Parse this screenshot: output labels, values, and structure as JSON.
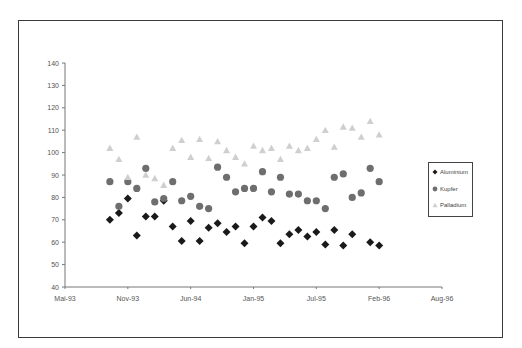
{
  "chart_data": {
    "type": "scatter",
    "title": "",
    "xlabel": "",
    "ylabel": "",
    "ylim": [
      40,
      140
    ],
    "y_ticks": [
      40,
      50,
      60,
      70,
      80,
      90,
      100,
      110,
      120,
      130,
      140
    ],
    "x_tick_labels": [
      "Mai-93",
      "Nov-93",
      "Jun-94",
      "Jan-95",
      "Jul-95",
      "Feb-96",
      "Aug-96"
    ],
    "grid": false,
    "legend_position": "right",
    "x": [
      "Oct-93",
      "Nov-93",
      "Dec-93",
      "Jan-94",
      "Feb-94",
      "Mar-94",
      "Apr-94",
      "May-94",
      "Jun-94",
      "Jul-94",
      "Aug-94",
      "Sep-94",
      "Oct-94",
      "Nov-94",
      "Dec-94",
      "Jan-95",
      "Feb-95",
      "Mar-95",
      "Apr-95",
      "May-95",
      "Jun-95",
      "Jul-95",
      "Aug-95",
      "Sep-95",
      "Oct-95",
      "Nov-95",
      "Dec-95",
      "Jan-96",
      "Feb-96",
      "Mar-96",
      "Apr-96"
    ],
    "series": [
      {
        "name": "Aluminium",
        "marker": "diamond",
        "color": "#1a1a1a",
        "values": [
          70,
          73,
          79.5,
          63,
          71.5,
          71.5,
          78.5,
          67,
          60.5,
          69.5,
          60.5,
          66.5,
          68.5,
          64.5,
          67,
          59.5,
          67,
          71,
          69.5,
          59.5,
          63.5,
          65.5,
          62.5,
          64.5,
          59,
          65.5,
          58.5,
          63.5,
          null,
          60,
          58.5
        ]
      },
      {
        "name": "Kupfer",
        "marker": "circle",
        "color": "#6e6e6e",
        "values": [
          87,
          76,
          87,
          84,
          93,
          78,
          79.5,
          87,
          78.5,
          80.5,
          76,
          75,
          93.5,
          89,
          82.5,
          84,
          84,
          91.5,
          82.5,
          89,
          81.5,
          81.5,
          78.5,
          78.5,
          75,
          89,
          90.5,
          80,
          82,
          93,
          87
        ]
      },
      {
        "name": "Palladium",
        "marker": "triangle",
        "color": "#cfcfcf",
        "values": [
          102,
          97,
          89,
          107,
          90,
          88.5,
          85.5,
          102,
          105.5,
          98,
          106,
          97.5,
          105,
          101,
          98,
          95,
          103,
          101,
          102,
          97,
          103,
          101,
          102,
          106,
          110,
          102.5,
          111.5,
          111,
          107,
          114,
          108
        ]
      }
    ]
  },
  "legend": {
    "items": [
      {
        "label": "Aluminium"
      },
      {
        "label": "Kupfer"
      },
      {
        "label": "Palladium"
      }
    ]
  }
}
